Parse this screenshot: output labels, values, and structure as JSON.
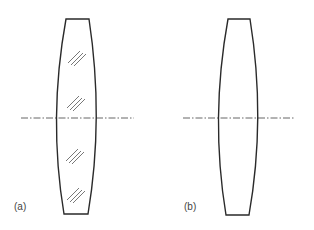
{
  "figure": {
    "type": "optical lens diagram",
    "panels": [
      {
        "id": "a",
        "label": "(a)",
        "description": "Biconvex lens with glass hatching",
        "hatched": true
      },
      {
        "id": "b",
        "label": "(b)",
        "description": "Biconvex lens outline without hatching",
        "hatched": false
      }
    ],
    "colors": {
      "outline": "#2a2a2a",
      "axis": "#555555",
      "hatch": "#555555",
      "background": "#ffffff"
    }
  }
}
